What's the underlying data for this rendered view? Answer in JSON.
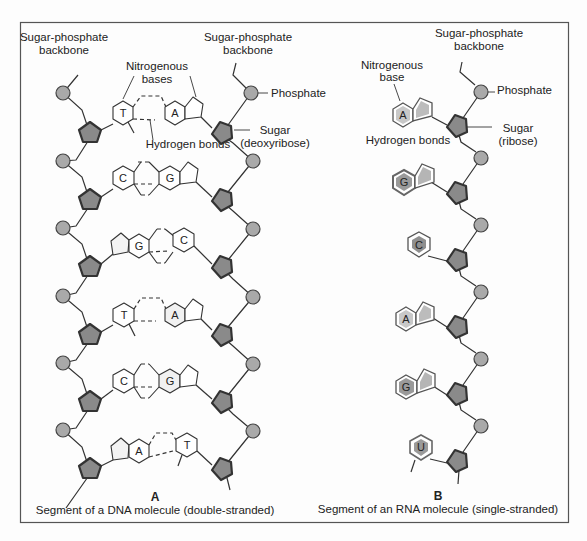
{
  "colors": {
    "phosphate": "#a9a9a9",
    "sugar": "#8a8a8a",
    "rna_base_purine_A": "#c8c8c8",
    "rna_base_G": "#9a9a9a",
    "rna_base_C": "#8f8f8f",
    "frame": "#555555"
  },
  "dna": {
    "labels": {
      "backbone_left": [
        "Sugar-phosphate",
        "backbone"
      ],
      "backbone_right": [
        "Sugar-phosphate",
        "backbone"
      ],
      "nitrogenous_bases": [
        "Nitrogenous",
        "bases"
      ],
      "hydrogen_bonds": "Hydrogen bonds",
      "phosphate": "Phosphate",
      "sugar": [
        "Sugar",
        "(deoxyribose)"
      ]
    },
    "pairs": [
      {
        "left": "T",
        "right": "A"
      },
      {
        "left": "C",
        "right": "G"
      },
      {
        "left": "G",
        "right": "C"
      },
      {
        "left": "T",
        "right": "A"
      },
      {
        "left": "C",
        "right": "G"
      },
      {
        "left": "A",
        "right": "T"
      }
    ],
    "panel_letter": "A",
    "caption": "Segment of a DNA molecule (double-stranded)"
  },
  "rna": {
    "labels": {
      "backbone": [
        "Sugar-phosphate",
        "backbone"
      ],
      "nitrogenous_base": [
        "Nitrogenous",
        "base"
      ],
      "hydrogen_bonds": "Hydrogen bonds",
      "phosphate": "Phosphate",
      "sugar": [
        "Sugar",
        "(ribose)"
      ]
    },
    "bases": [
      "A",
      "G",
      "C",
      "A",
      "G",
      "U"
    ],
    "panel_letter": "B",
    "caption": "Segment of an RNA molecule (single-stranded)"
  }
}
